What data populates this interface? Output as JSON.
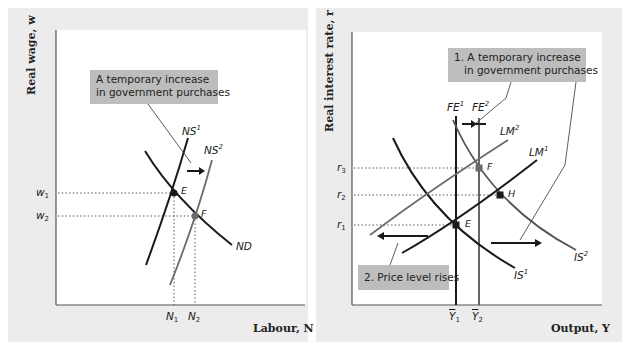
{
  "left_panel": {
    "y_axis_title": "Real wage, w",
    "x_axis_title": "Labour, N",
    "callout": {
      "line1": "A temporary increase",
      "line2": "in government purchases"
    },
    "curves": {
      "ns1": {
        "name": "NS",
        "sup": "1"
      },
      "ns2": {
        "name": "NS",
        "sup": "2"
      },
      "nd": {
        "name": "ND"
      }
    },
    "points": {
      "e": "E",
      "f": "F"
    },
    "y_ticks": [
      {
        "name": "w",
        "sub": "1"
      },
      {
        "name": "w",
        "sub": "2"
      }
    ],
    "x_ticks": [
      {
        "name": "N",
        "sub": "1"
      },
      {
        "name": "N",
        "sub": "2"
      }
    ]
  },
  "right_panel": {
    "y_axis_title": "Real interest rate, r",
    "x_axis_title": "Output, Y",
    "callout1": {
      "line1": "1. A temporary increase",
      "line2": "in government purchases"
    },
    "callout2": {
      "text": "2. Price level rises"
    },
    "curves": {
      "fe1": {
        "name": "FE",
        "sup": "1"
      },
      "fe2": {
        "name": "FE",
        "sup": "2"
      },
      "lm1": {
        "name": "LM",
        "sup": "1"
      },
      "lm2": {
        "name": "LM",
        "sup": "2"
      },
      "is1": {
        "name": "IS",
        "sup": "1"
      },
      "is2": {
        "name": "IS",
        "sup": "2"
      }
    },
    "points": {
      "e": "E",
      "f": "F",
      "h": "H"
    },
    "y_ticks": [
      {
        "name": "r",
        "sub": "3"
      },
      {
        "name": "r",
        "sub": "2"
      },
      {
        "name": "r",
        "sub": "1"
      }
    ],
    "x_ticks": [
      {
        "name": "Y",
        "sub": "1"
      },
      {
        "name": "Y",
        "sub": "2"
      }
    ]
  },
  "colors": {
    "panel_bg": "#ececec",
    "callout_bg": "#bdbdbd",
    "curve_dark": "#1a1a1a",
    "curve_gray": "#6b6b6b"
  }
}
